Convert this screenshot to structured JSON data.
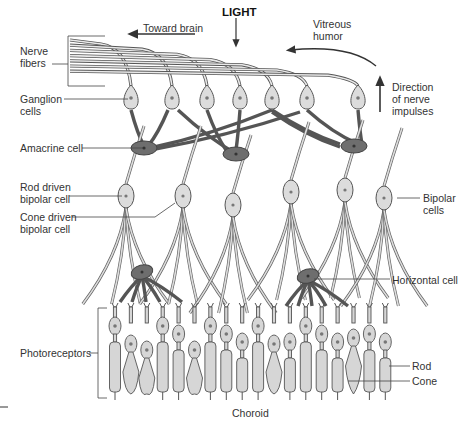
{
  "labels": {
    "toward_brain": "Toward brain",
    "light": "LIGHT",
    "vitreous_humor": "Vitreous\nhumor",
    "nerve_fibers": "Nerve\nfibers",
    "ganglion_cells": "Ganglion\ncells",
    "direction_of_nerve_impulses": "Direction\nof nerve\nimpulses",
    "amacrine_cell": "Amacrine cell",
    "rod_driven_bipolar_cell": "Rod driven\nbipolar cell",
    "cone_driven_bipolar_cell": "Cone driven\nbipolar cell",
    "bipolar_cells": "Bipolar\ncells",
    "horizontal_cell": "Horizontal cell",
    "photoreceptors": "Photoreceptors",
    "rod": "Rod",
    "cone": "Cone",
    "choroid": "Choroid"
  },
  "photoreceptor_types": [
    "rod",
    "cone",
    "cone",
    "rod",
    "rod",
    "cone",
    "rod",
    "rod",
    "rod",
    "rod",
    "cone",
    "rod",
    "rod",
    "rod",
    "rod",
    "cone",
    "rod",
    "rod"
  ],
  "counts": {
    "ganglion_cells": 7,
    "amacrine_cells": 3,
    "bipolar_cells": 6,
    "horizontal_cells": 2,
    "nerve_fibers": 7
  }
}
